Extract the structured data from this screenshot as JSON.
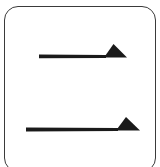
{
  "icon": {
    "name": "two-arrow-lines-icon",
    "label": "二",
    "stroke_color": "#1a1a1a",
    "border_color": "#3a3a3a",
    "background": "#ffffff"
  }
}
